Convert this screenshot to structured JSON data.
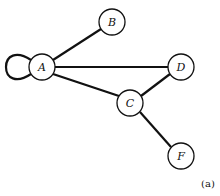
{
  "diagram": {
    "type": "graph",
    "nodes": [
      {
        "id": "A",
        "label": "A",
        "x": 42,
        "y": 67
      },
      {
        "id": "B",
        "label": "B",
        "x": 112,
        "y": 22
      },
      {
        "id": "D",
        "label": "D",
        "x": 181,
        "y": 67
      },
      {
        "id": "C",
        "label": "C",
        "x": 130,
        "y": 103
      },
      {
        "id": "F",
        "label": "F",
        "x": 181,
        "y": 156
      }
    ],
    "edges": [
      {
        "from": "A",
        "to": "A",
        "kind": "self-loop"
      },
      {
        "from": "A",
        "to": "B"
      },
      {
        "from": "A",
        "to": "D"
      },
      {
        "from": "A",
        "to": "C"
      },
      {
        "from": "C",
        "to": "D"
      },
      {
        "from": "C",
        "to": "F"
      }
    ],
    "caption": "(a)",
    "colors": {
      "stroke": "#111111",
      "fill": "#ffffff"
    }
  }
}
